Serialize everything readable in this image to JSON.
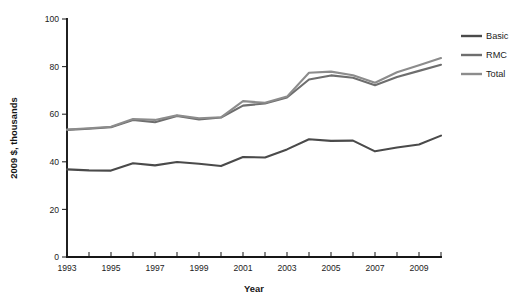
{
  "chart_data": {
    "type": "line",
    "title": "",
    "xlabel": "Year",
    "ylabel": "2009 $, thousands",
    "xlim": [
      1993,
      2010
    ],
    "ylim": [
      0,
      100
    ],
    "grid": false,
    "legend_position": "right",
    "x": [
      1993,
      1994,
      1995,
      1996,
      1997,
      1998,
      1999,
      2000,
      2001,
      2002,
      2003,
      2004,
      2005,
      2006,
      2007,
      2008,
      2009,
      2010
    ],
    "y_ticks": [
      0,
      20,
      40,
      60,
      80,
      100
    ],
    "y_tick_labels": [
      "0",
      "20",
      "40",
      "60",
      "80",
      "100"
    ],
    "x_ticks": [
      1993,
      1994,
      1995,
      1996,
      1997,
      1998,
      1999,
      2000,
      2001,
      2002,
      2003,
      2004,
      2005,
      2006,
      2007,
      2008,
      2009,
      2010
    ],
    "x_tick_labels": [
      "1993",
      "",
      "1995",
      "",
      "1997",
      "",
      "1999",
      "",
      "2001",
      "",
      "2003",
      "",
      "2005",
      "",
      "2007",
      "",
      "2009",
      ""
    ],
    "series": [
      {
        "name": "Basic",
        "color": "#4a4a4a",
        "values": [
          36.8,
          36.4,
          36.3,
          39.4,
          38.5,
          39.9,
          39.2,
          38.2,
          42.0,
          41.8,
          45.2,
          49.5,
          48.8,
          48.9,
          44.4,
          46.0,
          47.3,
          51.0
        ]
      },
      {
        "name": "RMC",
        "color": "#6e6e6e",
        "values": [
          53.4,
          53.9,
          54.5,
          57.6,
          56.6,
          59.3,
          57.8,
          58.6,
          63.6,
          64.5,
          67.0,
          74.6,
          76.3,
          75.3,
          72.2,
          75.6,
          78.2,
          80.8
        ]
      },
      {
        "name": "Total",
        "color": "#8c8c8c",
        "values": [
          53.6,
          54.1,
          54.7,
          58.0,
          57.6,
          59.5,
          58.3,
          58.7,
          65.5,
          64.8,
          67.4,
          77.4,
          77.9,
          76.4,
          73.2,
          77.6,
          80.6,
          83.6
        ]
      }
    ],
    "legend": [
      {
        "label": "Basic",
        "color": "#4a4a4a"
      },
      {
        "label": "RMC",
        "color": "#6e6e6e"
      },
      {
        "label": "Total",
        "color": "#8c8c8c"
      }
    ]
  },
  "figure": {
    "background": "#ffffff",
    "axis_color": "#161616"
  }
}
